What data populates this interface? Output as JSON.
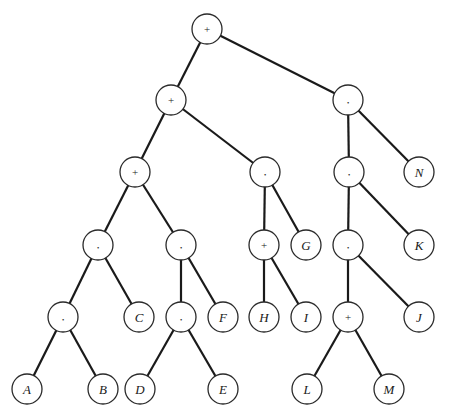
{
  "diagram": {
    "type": "expression-tree",
    "node_radius": 15,
    "colors": {
      "stroke": "#2a2a2a",
      "edge": "#1a1a1a",
      "fill": "#ffffff",
      "text": "#1a1a1a"
    },
    "nodes": [
      {
        "id": "n0",
        "label": "+",
        "kind": "op",
        "x": 207,
        "y": 29
      },
      {
        "id": "n1",
        "label": "+",
        "kind": "op",
        "x": 171,
        "y": 100
      },
      {
        "id": "n2",
        "label": "*",
        "kind": "op",
        "x": 348,
        "y": 100
      },
      {
        "id": "n3",
        "label": "+",
        "kind": "op",
        "x": 135,
        "y": 172
      },
      {
        "id": "n4",
        "label": "*",
        "kind": "op",
        "x": 265,
        "y": 172
      },
      {
        "id": "n5",
        "label": "*",
        "kind": "op",
        "x": 349,
        "y": 172
      },
      {
        "id": "n6",
        "label": "N",
        "kind": "var",
        "x": 419,
        "y": 172
      },
      {
        "id": "n7",
        "label": "*",
        "kind": "op",
        "x": 98,
        "y": 245
      },
      {
        "id": "n8",
        "label": "*",
        "kind": "op",
        "x": 181,
        "y": 245
      },
      {
        "id": "n9",
        "label": "+",
        "kind": "op",
        "x": 264,
        "y": 245
      },
      {
        "id": "n10",
        "label": "G",
        "kind": "var",
        "x": 306,
        "y": 245
      },
      {
        "id": "n11",
        "label": "*",
        "kind": "op",
        "x": 348,
        "y": 245
      },
      {
        "id": "n12",
        "label": "K",
        "kind": "var",
        "x": 419,
        "y": 245
      },
      {
        "id": "n13",
        "label": "*",
        "kind": "op",
        "x": 63,
        "y": 317
      },
      {
        "id": "n14",
        "label": "C",
        "kind": "var",
        "x": 139,
        "y": 317
      },
      {
        "id": "n15",
        "label": "*",
        "kind": "op",
        "x": 181,
        "y": 317
      },
      {
        "id": "n16",
        "label": "F",
        "kind": "var",
        "x": 223,
        "y": 317
      },
      {
        "id": "n17",
        "label": "H",
        "kind": "var",
        "x": 264,
        "y": 317
      },
      {
        "id": "n18",
        "label": "I",
        "kind": "var",
        "x": 306,
        "y": 317
      },
      {
        "id": "n19",
        "label": "+",
        "kind": "op",
        "x": 348,
        "y": 317
      },
      {
        "id": "n20",
        "label": "J",
        "kind": "var",
        "x": 419,
        "y": 317
      },
      {
        "id": "n21",
        "label": "A",
        "kind": "var",
        "x": 27,
        "y": 389
      },
      {
        "id": "n22",
        "label": "B",
        "kind": "var",
        "x": 103,
        "y": 389
      },
      {
        "id": "n23",
        "label": "D",
        "kind": "var",
        "x": 140,
        "y": 389
      },
      {
        "id": "n24",
        "label": "E",
        "kind": "var",
        "x": 223,
        "y": 389
      },
      {
        "id": "n25",
        "label": "L",
        "kind": "var",
        "x": 307,
        "y": 389
      },
      {
        "id": "n26",
        "label": "M",
        "kind": "var",
        "x": 389,
        "y": 389
      }
    ],
    "edges": [
      [
        "n0",
        "n1"
      ],
      [
        "n0",
        "n2"
      ],
      [
        "n1",
        "n3"
      ],
      [
        "n1",
        "n4"
      ],
      [
        "n2",
        "n5"
      ],
      [
        "n2",
        "n6"
      ],
      [
        "n3",
        "n7"
      ],
      [
        "n3",
        "n8"
      ],
      [
        "n4",
        "n9"
      ],
      [
        "n4",
        "n10"
      ],
      [
        "n5",
        "n11"
      ],
      [
        "n5",
        "n12"
      ],
      [
        "n7",
        "n13"
      ],
      [
        "n7",
        "n14"
      ],
      [
        "n8",
        "n15"
      ],
      [
        "n8",
        "n16"
      ],
      [
        "n9",
        "n17"
      ],
      [
        "n9",
        "n18"
      ],
      [
        "n11",
        "n19"
      ],
      [
        "n11",
        "n20"
      ],
      [
        "n13",
        "n21"
      ],
      [
        "n13",
        "n22"
      ],
      [
        "n15",
        "n23"
      ],
      [
        "n15",
        "n24"
      ],
      [
        "n19",
        "n25"
      ],
      [
        "n19",
        "n26"
      ]
    ]
  }
}
